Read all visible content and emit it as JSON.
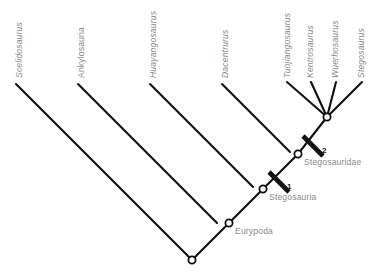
{
  "figure": {
    "type": "cladogram",
    "background_color": "#ffffff",
    "branch_color": "#111111",
    "taxon_label_color": "#8a8a8a",
    "clade_label_color": "#8a8a8a",
    "marker_label_color": "#111111"
  },
  "taxa": [
    {
      "id": "scelidosaurus",
      "label": "Scelidosaurus",
      "italic": true,
      "label_x": 22,
      "label_y": 78,
      "tip_x": 16,
      "tip_y": 84
    },
    {
      "id": "ankylosauria",
      "label": "Ankylosauria",
      "italic": false,
      "label_x": 84,
      "label_y": 78,
      "tip_x": 78,
      "tip_y": 84
    },
    {
      "id": "huayangosaurus",
      "label": "Huayangosaurus",
      "italic": true,
      "label_x": 156,
      "label_y": 78,
      "tip_x": 150,
      "tip_y": 84
    },
    {
      "id": "dacentrurus",
      "label": "Dacentrurus",
      "italic": true,
      "label_x": 228,
      "label_y": 78,
      "tip_x": 222,
      "tip_y": 84
    },
    {
      "id": "tuojiangosaurus",
      "label": "Tuojiangosaurus",
      "italic": true,
      "label_x": 290,
      "label_y": 78,
      "tip_x": 287,
      "tip_y": 82
    },
    {
      "id": "kentrosaurus",
      "label": "Kentrosaurus",
      "italic": true,
      "label_x": 313,
      "label_y": 78,
      "tip_x": 311,
      "tip_y": 82
    },
    {
      "id": "wuerhosaurus",
      "label": "Wuerhosaurus",
      "italic": true,
      "label_x": 338,
      "label_y": 78,
      "tip_x": 336,
      "tip_y": 82
    },
    {
      "id": "stegosaurus",
      "label": "Stegosaurus",
      "italic": true,
      "label_x": 364,
      "label_y": 78,
      "tip_x": 362,
      "tip_y": 82
    }
  ],
  "nodes": [
    {
      "id": "root",
      "label": "",
      "x": 192,
      "y": 260,
      "label_x": 0,
      "label_y": 0
    },
    {
      "id": "eurypoda",
      "label": "Eurypoda",
      "x": 229,
      "y": 223,
      "label_x": 235,
      "label_y": 234
    },
    {
      "id": "stegosauria",
      "label": "Stegosauria",
      "x": 263,
      "y": 189,
      "label_x": 269,
      "label_y": 200
    },
    {
      "id": "stegosauridae",
      "label": "Stegosauridae",
      "x": 298,
      "y": 154,
      "label_x": 304,
      "label_y": 165
    },
    {
      "id": "polytomy",
      "label": "",
      "x": 327,
      "y": 117,
      "label_x": 0,
      "label_y": 0
    }
  ],
  "branches": [
    {
      "id": "branch-scelidosaurus",
      "x1": 16,
      "y1": 84,
      "x2": 192,
      "y2": 260
    },
    {
      "id": "branch-ankylosauria",
      "x1": 78,
      "y1": 84,
      "x2": 217,
      "y2": 223
    },
    {
      "id": "branch-huayangosaurus",
      "x1": 150,
      "y1": 84,
      "x2": 253,
      "y2": 187
    },
    {
      "id": "branch-dacentrurus",
      "x1": 222,
      "y1": 84,
      "x2": 290,
      "y2": 152
    },
    {
      "id": "branch-tuojiangosaurus",
      "x1": 287,
      "y1": 82,
      "x2": 327,
      "y2": 117
    },
    {
      "id": "branch-kentrosaurus",
      "x1": 311,
      "y1": 82,
      "x2": 327,
      "y2": 117
    },
    {
      "id": "branch-wuerhosaurus",
      "x1": 336,
      "y1": 82,
      "x2": 327,
      "y2": 117
    },
    {
      "id": "branch-stegosaurus",
      "x1": 362,
      "y1": 82,
      "x2": 327,
      "y2": 117
    },
    {
      "id": "branch-root-eurypoda",
      "x1": 192,
      "y1": 260,
      "x2": 229,
      "y2": 223
    },
    {
      "id": "branch-eurypoda-stegosauria",
      "x1": 229,
      "y1": 223,
      "x2": 263,
      "y2": 189
    },
    {
      "id": "branch-stegosauria-stegosauridae",
      "x1": 263,
      "y1": 189,
      "x2": 298,
      "y2": 154
    },
    {
      "id": "branch-stegosauridae-polytomy",
      "x1": 298,
      "y1": 154,
      "x2": 327,
      "y2": 117
    }
  ],
  "markers": [
    {
      "id": "marker-1",
      "label": "1",
      "bar_x1": 269,
      "bar_y1": 172,
      "bar_x2": 289,
      "bar_y2": 192,
      "label_x": 287,
      "label_y": 189
    },
    {
      "id": "marker-2",
      "label": "2",
      "bar_x1": 303,
      "bar_y1": 136,
      "bar_x2": 323,
      "bar_y2": 156,
      "label_x": 322,
      "label_y": 153
    }
  ]
}
